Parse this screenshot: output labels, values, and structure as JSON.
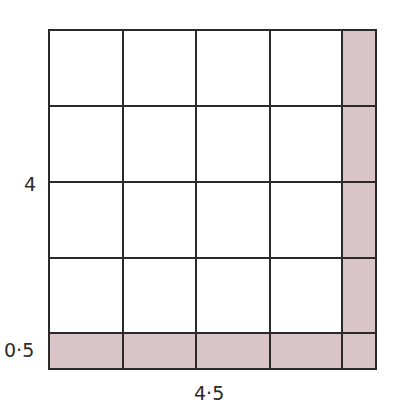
{
  "diagram": {
    "grid": {
      "columns": 5,
      "rows": 5,
      "main_cells": 4,
      "col_edges_px": [
        49,
        123,
        196,
        270,
        342,
        376
      ],
      "row_edges_px": [
        30,
        106,
        182,
        258,
        333,
        369
      ]
    },
    "shaded_regions": [
      "right column (width 0.5)",
      "bottom row (height 0.5)"
    ],
    "colors": {
      "shade": "#d9c4c8",
      "line": "#2a2a2a",
      "background": "#ffffff"
    },
    "labels": {
      "side_main": "4",
      "side_strip": "0·5",
      "total_bottom": "4·5"
    }
  }
}
